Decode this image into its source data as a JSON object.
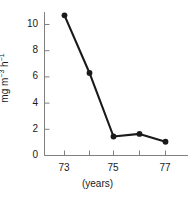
{
  "chart_data": {
    "type": "line",
    "title": "",
    "xlabel": "(years)",
    "ylabel": "mg m-3 h-1",
    "ylabel_parts": {
      "base1": "mg m",
      "exp1": "−3",
      "base2": " h",
      "exp2": "−1"
    },
    "x": [
      73,
      74,
      75,
      76,
      77
    ],
    "values": [
      10.7,
      6.3,
      1.45,
      1.65,
      1.05
    ],
    "series": [
      {
        "name": "rate",
        "values": [
          10.7,
          6.3,
          1.45,
          1.65,
          1.05
        ]
      }
    ],
    "xlim": [
      72.2,
      77.8
    ],
    "ylim": [
      0,
      11.2
    ],
    "xticks": [
      73,
      74,
      75,
      76,
      77
    ],
    "xtick_labels": [
      "73",
      "",
      "75",
      "",
      "77"
    ],
    "yticks": [
      0,
      2,
      4,
      6,
      8,
      10
    ],
    "ytick_labels": [
      "0",
      "2",
      "4",
      "6",
      "8",
      "10"
    ],
    "grid": false,
    "legend": "none",
    "marker": "filled-circle",
    "line_color": "#1a1a1a",
    "marker_color": "#1a1a1a",
    "axis_color": "#808080"
  }
}
